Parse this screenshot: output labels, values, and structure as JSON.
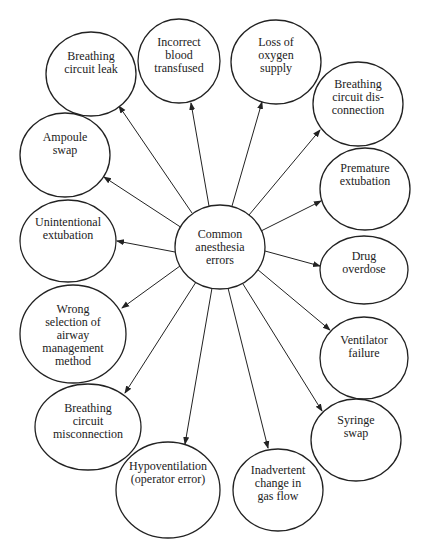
{
  "diagram": {
    "type": "hub-and-spoke",
    "colors": {
      "stroke": "#222222",
      "text": "#222222",
      "background": "#ffffff"
    },
    "center": {
      "id": "center",
      "lines": [
        "Common",
        "anesthesia",
        "errors"
      ],
      "cx": 220,
      "cy": 247,
      "rx": 45,
      "ry": 42
    },
    "nodes": [
      {
        "id": "breathing-circuit-leak",
        "lines": [
          "Breathing",
          "circuit leak"
        ],
        "cx": 91,
        "cy": 74,
        "rx": 45,
        "ry": 42,
        "text_top": 50
      },
      {
        "id": "incorrect-blood-transfused",
        "lines": [
          "Incorrect",
          "blood",
          "transfused"
        ],
        "cx": 179,
        "cy": 61,
        "rx": 41,
        "ry": 42,
        "text_top": 36
      },
      {
        "id": "loss-of-oxygen-supply",
        "lines": [
          "Loss of",
          "oxygen",
          "supply"
        ],
        "cx": 276,
        "cy": 62,
        "rx": 45,
        "ry": 42,
        "text_top": 36
      },
      {
        "id": "breathing-circuit-disconnection",
        "lines": [
          "Breathing",
          "circuit dis-",
          "connection"
        ],
        "cx": 358,
        "cy": 104,
        "rx": 45,
        "ry": 42,
        "text_top": 78
      },
      {
        "id": "premature-extubation",
        "lines": [
          "Premature",
          "extubation"
        ],
        "cx": 365,
        "cy": 189,
        "rx": 45,
        "ry": 41,
        "text_top": 162
      },
      {
        "id": "drug-overdose",
        "lines": [
          "Drug",
          "overdose"
        ],
        "cx": 364,
        "cy": 270,
        "rx": 44,
        "ry": 34,
        "text_top": 250
      },
      {
        "id": "ventilator-failure",
        "lines": [
          "Ventilator",
          "failure"
        ],
        "cx": 364,
        "cy": 358,
        "rx": 44,
        "ry": 41,
        "text_top": 334
      },
      {
        "id": "syringe-swap",
        "lines": [
          "Syringe",
          "swap"
        ],
        "cx": 356,
        "cy": 440,
        "rx": 45,
        "ry": 41,
        "text_top": 414
      },
      {
        "id": "inadvertent-change-in-gas-flow",
        "lines": [
          "Inadvertent",
          "change in",
          "gas flow"
        ],
        "cx": 278,
        "cy": 490,
        "rx": 45,
        "ry": 41,
        "text_top": 464
      },
      {
        "id": "hypoventilation",
        "lines": [
          "Hypoventilation",
          "(operator error)"
        ],
        "cx": 168,
        "cy": 490,
        "rx": 52,
        "ry": 48,
        "text_top": 460
      },
      {
        "id": "breathing-circuit-misconnection",
        "lines": [
          "Breathing",
          "circuit",
          "misconnection"
        ],
        "cx": 88,
        "cy": 427,
        "rx": 53,
        "ry": 43,
        "text_top": 402
      },
      {
        "id": "wrong-selection-airway",
        "lines": [
          "Wrong",
          "selection of",
          "airway",
          "management",
          "method"
        ],
        "cx": 73,
        "cy": 334,
        "rx": 53,
        "ry": 49,
        "text_top": 303
      },
      {
        "id": "unintentional-extubation",
        "lines": [
          "Unintentional",
          "extubation"
        ],
        "cx": 68,
        "cy": 241,
        "rx": 48,
        "ry": 41,
        "text_top": 216
      },
      {
        "id": "ampoule-swap",
        "lines": [
          "Ampoule",
          "swap"
        ],
        "cx": 65,
        "cy": 155,
        "rx": 45,
        "ry": 42,
        "text_top": 131
      }
    ],
    "edges": [
      {
        "from": "center",
        "to": "breathing-circuit-leak",
        "x1": 192,
        "y1": 213,
        "x2": 119,
        "y2": 106
      },
      {
        "from": "center",
        "to": "incorrect-blood-transfused",
        "x1": 209,
        "y1": 206,
        "x2": 191,
        "y2": 103
      },
      {
        "from": "center",
        "to": "loss-of-oxygen-supply",
        "x1": 232,
        "y1": 206,
        "x2": 262,
        "y2": 102
      },
      {
        "from": "center",
        "to": "breathing-circuit-disconnection",
        "x1": 249,
        "y1": 215,
        "x2": 320,
        "y2": 130
      },
      {
        "from": "center",
        "to": "premature-extubation",
        "x1": 261,
        "y1": 231,
        "x2": 321,
        "y2": 201
      },
      {
        "from": "center",
        "to": "drug-overdose",
        "x1": 265,
        "y1": 251,
        "x2": 320,
        "y2": 266
      },
      {
        "from": "center",
        "to": "ventilator-failure",
        "x1": 257,
        "y1": 269,
        "x2": 330,
        "y2": 330
      },
      {
        "from": "center",
        "to": "syringe-swap",
        "x1": 243,
        "y1": 284,
        "x2": 322,
        "y2": 411
      },
      {
        "from": "center",
        "to": "inadvertent-change-in-gas-flow",
        "x1": 228,
        "y1": 288,
        "x2": 268,
        "y2": 448
      },
      {
        "from": "center",
        "to": "hypoventilation",
        "x1": 212,
        "y1": 288,
        "x2": 185,
        "y2": 444
      },
      {
        "from": "center",
        "to": "breathing-circuit-misconnection",
        "x1": 196,
        "y1": 282,
        "x2": 125,
        "y2": 393
      },
      {
        "from": "center",
        "to": "wrong-selection-airway",
        "x1": 180,
        "y1": 266,
        "x2": 122,
        "y2": 308
      },
      {
        "from": "center",
        "to": "unintentional-extubation",
        "x1": 175,
        "y1": 252,
        "x2": 117,
        "y2": 241
      },
      {
        "from": "center",
        "to": "ampoule-swap",
        "x1": 182,
        "y1": 228,
        "x2": 104,
        "y2": 177
      }
    ]
  }
}
